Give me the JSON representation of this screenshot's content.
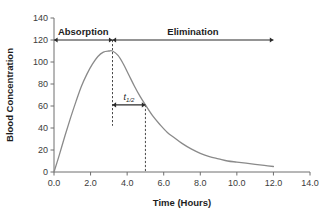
{
  "chart_data": {
    "type": "line",
    "title": "",
    "xlabel": "Time (Hours)",
    "ylabel": "Blood Concentration",
    "xlim": [
      0.0,
      14.0
    ],
    "ylim": [
      0,
      140
    ],
    "grid": false,
    "legend": null,
    "x_ticks": [
      "0.0",
      "2.0",
      "4.0",
      "6.0",
      "8.0",
      "10.0",
      "12.0",
      "14.0"
    ],
    "x_tick_values": [
      0,
      2,
      4,
      6,
      8,
      10,
      12,
      14
    ],
    "y_ticks": [
      "0",
      "20",
      "40",
      "60",
      "80",
      "100",
      "120",
      "140"
    ],
    "y_tick_values": [
      0,
      20,
      40,
      60,
      80,
      100,
      120,
      140
    ],
    "series": [
      {
        "name": "Blood Concentration",
        "color": "#8a8a8a",
        "x": [
          0.0,
          0.3,
          0.6,
          0.9,
          1.2,
          1.5,
          1.8,
          2.1,
          2.4,
          2.7,
          3.0,
          3.2,
          3.5,
          3.8,
          4.1,
          4.4,
          4.7,
          5.0,
          5.4,
          5.8,
          6.2,
          6.6,
          7.0,
          7.5,
          8.0,
          8.5,
          9.0,
          9.5,
          10.0,
          10.5,
          11.0,
          11.5,
          12.0
        ],
        "y": [
          0,
          16,
          33,
          49,
          64,
          78,
          89,
          98,
          105,
          109,
          110,
          110,
          106,
          98,
          88,
          78,
          69,
          61,
          51,
          43,
          36,
          31,
          26,
          21,
          17,
          14,
          12,
          10,
          9,
          8,
          7,
          6,
          5
        ]
      }
    ],
    "annotations": [
      {
        "name": "absorption",
        "label": "Absorption",
        "x_start": 0.0,
        "x_end": 3.2,
        "y": 120,
        "style": "double-arrow"
      },
      {
        "name": "elimination",
        "label": "Elimination",
        "x_start": 3.2,
        "x_end": 12.0,
        "y": 120,
        "style": "double-arrow"
      },
      {
        "name": "half-life",
        "label": "t",
        "sublabel": "1/2",
        "x_start": 3.2,
        "x_end": 5.0,
        "y": 61,
        "style": "double-arrow"
      }
    ],
    "guides": [
      {
        "name": "peak-time-guide",
        "x": 3.2,
        "y_top": 120,
        "y_bottom": 42,
        "style": "dashed"
      },
      {
        "name": "half-life-guide",
        "x": 5.0,
        "y_top": 61,
        "y_bottom": 0,
        "style": "dashed"
      }
    ],
    "peak": {
      "time": 3.2,
      "concentration": 110
    },
    "half_life_hours": 1.8,
    "colors": {
      "curve": "#8a8a8a",
      "axis": "#6e6e6e",
      "annotation": "#2b2b2b",
      "text": "#1d1d1d",
      "background": "#ffffff"
    }
  }
}
